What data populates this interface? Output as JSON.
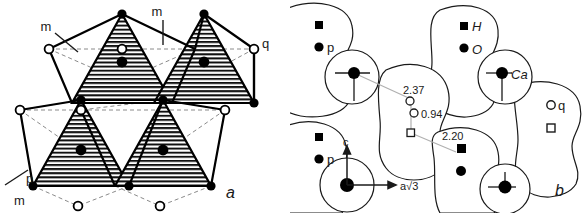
{
  "figure": {
    "panels": [
      {
        "id": "a",
        "panel_label": "a",
        "name": "tetrahedral-sheet-plan-view",
        "labels": [
          {
            "key": "m_top",
            "text": "m",
            "role": "mirror-plane-label"
          },
          {
            "key": "m_upper_left",
            "text": "m",
            "role": "mirror-plane-label"
          },
          {
            "key": "m_lower_left",
            "text": "m",
            "role": "mirror-plane-label"
          },
          {
            "key": "p",
            "text": "p",
            "role": "site-label"
          },
          {
            "key": "q",
            "text": "q",
            "role": "site-label"
          }
        ]
      },
      {
        "id": "b",
        "panel_label": "b",
        "name": "packing-projection-view",
        "legend": [
          {
            "symbol": "filled-square",
            "text": "H"
          },
          {
            "symbol": "filled-circle",
            "text": "O"
          },
          {
            "symbol": "filled-circle-cross",
            "text": "Ca"
          }
        ],
        "site_labels": [
          {
            "key": "p_upper",
            "symbol": "filled-circle",
            "text": "p"
          },
          {
            "key": "p_lower",
            "symbol": "filled-circle",
            "text": "p"
          },
          {
            "key": "q",
            "symbol": "open-circle",
            "text": "q"
          }
        ],
        "distances": [
          {
            "key": "d_237",
            "text": "2.37"
          },
          {
            "key": "d_094",
            "text": "0.94"
          },
          {
            "key": "d_220",
            "text": "2.20"
          }
        ],
        "axes": [
          {
            "key": "c_axis",
            "text": "c",
            "direction": "up"
          },
          {
            "key": "a_axis",
            "text": "a√3",
            "direction": "right"
          }
        ]
      }
    ]
  },
  "colors": {
    "ink": "#1a1a1a",
    "line": "#000000",
    "dashed": "#7a7a7a",
    "hatch": "#111111",
    "background": "#ffffff",
    "leader": "#9a9a9a"
  }
}
